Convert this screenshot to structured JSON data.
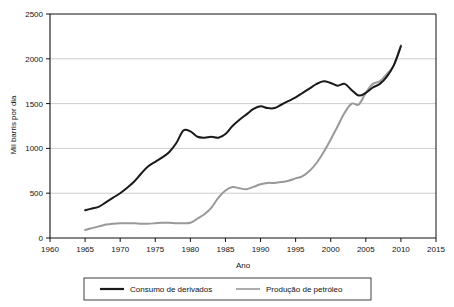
{
  "chart_data": {
    "type": "line",
    "title": "",
    "xlabel": "Ano",
    "ylabel": "Mil barris por dia",
    "xlim": [
      1960,
      2015
    ],
    "ylim": [
      0,
      2500
    ],
    "xticks": [
      1960,
      1965,
      1970,
      1975,
      1980,
      1985,
      1990,
      1995,
      2000,
      2005,
      2010,
      2015
    ],
    "yticks": [
      0,
      500,
      1000,
      1500,
      2000,
      2500
    ],
    "grid": "horizontal",
    "legend_position": "bottom",
    "series": [
      {
        "name": "Consumo de derivados",
        "color": "#1a1a1a",
        "width": 2.0,
        "x": [
          1965,
          1966,
          1967,
          1968,
          1969,
          1970,
          1971,
          1972,
          1973,
          1974,
          1975,
          1976,
          1977,
          1978,
          1979,
          1980,
          1981,
          1982,
          1983,
          1984,
          1985,
          1986,
          1987,
          1988,
          1989,
          1990,
          1991,
          1992,
          1993,
          1994,
          1995,
          1996,
          1997,
          1998,
          1999,
          2000,
          2001,
          2002,
          2003,
          2004,
          2005,
          2006,
          2007,
          2008,
          2009,
          2010
        ],
        "values": [
          310,
          330,
          350,
          400,
          450,
          500,
          560,
          630,
          720,
          800,
          850,
          900,
          960,
          1060,
          1200,
          1190,
          1130,
          1120,
          1130,
          1120,
          1160,
          1250,
          1320,
          1380,
          1440,
          1470,
          1450,
          1450,
          1490,
          1530,
          1570,
          1620,
          1670,
          1720,
          1750,
          1730,
          1700,
          1720,
          1650,
          1590,
          1620,
          1680,
          1720,
          1800,
          1930,
          2140
        ]
      },
      {
        "name": "Produção de petróleo",
        "color": "#999999",
        "width": 2.0,
        "x": [
          1965,
          1966,
          1967,
          1968,
          1969,
          1970,
          1971,
          1972,
          1973,
          1974,
          1975,
          1976,
          1977,
          1978,
          1979,
          1980,
          1981,
          1982,
          1983,
          1984,
          1985,
          1986,
          1987,
          1988,
          1989,
          1990,
          1991,
          1992,
          1993,
          1994,
          1995,
          1996,
          1997,
          1998,
          1999,
          2000,
          2001,
          2002,
          2003,
          2004,
          2005,
          2006,
          2007,
          2008,
          2009,
          2010
        ],
        "values": [
          90,
          110,
          130,
          150,
          160,
          165,
          165,
          165,
          160,
          160,
          165,
          170,
          170,
          165,
          165,
          170,
          215,
          265,
          340,
          450,
          530,
          570,
          555,
          545,
          570,
          600,
          615,
          615,
          625,
          640,
          665,
          690,
          750,
          840,
          960,
          1100,
          1250,
          1400,
          1500,
          1490,
          1620,
          1720,
          1750,
          1830,
          1930,
          2150
        ]
      }
    ]
  },
  "legend": {
    "items": [
      {
        "label": "Consumo de derivados",
        "color": "#1a1a1a"
      },
      {
        "label": "Produção de petróleo",
        "color": "#999999"
      }
    ]
  },
  "axis": {
    "y_title": "Mil barris por dia",
    "x_title": "Ano"
  }
}
